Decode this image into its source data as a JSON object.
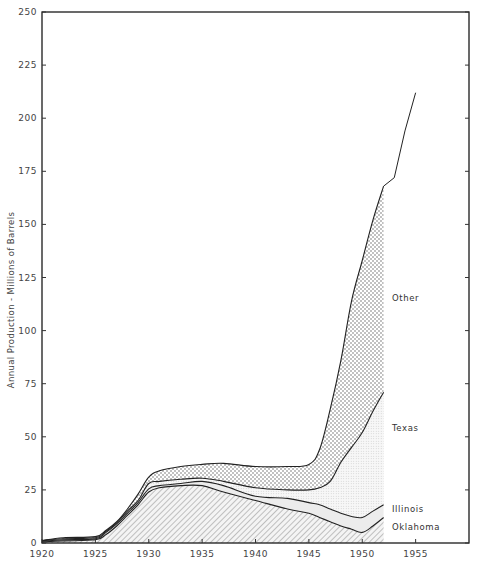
{
  "chart_data": {
    "type": "area",
    "stacked": true,
    "title": "",
    "xlabel": "",
    "ylabel": "Annual Production - Millions of Barrels",
    "xlim": [
      1920,
      1960
    ],
    "ylim": [
      0,
      250
    ],
    "x_ticks": [
      1920,
      1925,
      1930,
      1935,
      1940,
      1945,
      1950,
      1955
    ],
    "y_ticks": [
      0,
      25,
      50,
      75,
      100,
      125,
      150,
      175,
      200,
      225,
      250
    ],
    "grid": false,
    "legend_position": "inline-right",
    "x": [
      1920,
      1922,
      1925,
      1926,
      1927,
      1928,
      1929,
      1930,
      1931,
      1933,
      1935,
      1937,
      1940,
      1943,
      1945,
      1946,
      1947,
      1948,
      1949,
      1950,
      1951,
      1952
    ],
    "series": [
      {
        "name": "Oklahoma",
        "pattern": "hatch",
        "cumulative_top": [
          0.5,
          1,
          1.5,
          4,
          8,
          13,
          18,
          24,
          26,
          27,
          27,
          24,
          20,
          16,
          14,
          12,
          10,
          8,
          6.5,
          5,
          8,
          12
        ]
      },
      {
        "name": "Illinois",
        "pattern": "light",
        "cumulative_top": [
          0.8,
          1.5,
          2,
          5,
          9,
          14,
          19,
          25.5,
          27,
          28,
          29,
          27,
          22,
          21,
          19,
          18,
          16,
          14,
          12.5,
          12,
          15,
          18
        ]
      },
      {
        "name": "Texas",
        "pattern": "fine-dot",
        "cumulative_top": [
          1,
          2,
          2.5,
          5.5,
          9.5,
          15,
          20,
          28,
          29,
          30,
          30.5,
          29,
          26,
          25,
          25,
          26,
          29,
          38,
          45,
          52,
          62,
          71
        ]
      },
      {
        "name": "Other",
        "pattern": "coarse-dot",
        "cumulative_top": [
          1.2,
          2.5,
          3,
          6,
          10,
          16,
          23,
          31,
          34,
          36,
          37,
          37.5,
          36,
          36,
          37,
          44,
          63,
          86,
          114,
          133,
          152,
          168
        ]
      }
    ],
    "total_extension": {
      "name": "Total",
      "x": [
        1952,
        1953,
        1954,
        1955
      ],
      "values": [
        168,
        172,
        194,
        212
      ]
    },
    "series_labels": [
      "Other",
      "Texas",
      "Illinois",
      "Oklahoma"
    ]
  },
  "axes": {
    "y_title": "Annual Production - Millions of Barrels",
    "y_tick_labels": [
      "0",
      "25",
      "50",
      "75",
      "100",
      "125",
      "150",
      "175",
      "200",
      "225",
      "250"
    ],
    "x_tick_labels": [
      "1920",
      "1925",
      "1930",
      "1935",
      "1940",
      "1945",
      "1950",
      "1955"
    ]
  },
  "labels": {
    "other": "Other",
    "texas": "Texas",
    "illinois": "Illinois",
    "oklahoma": "Oklahoma"
  },
  "colors": {
    "line": "#222222",
    "hatch": "#8a8a8a",
    "light_fill": "#ececec",
    "dot": "#555555",
    "frame": "#1a1a1a"
  }
}
